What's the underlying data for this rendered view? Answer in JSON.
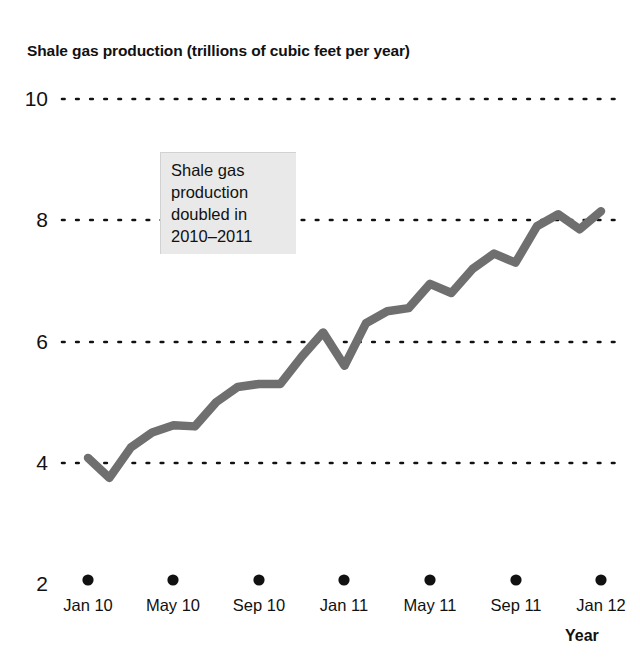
{
  "chart_data": {
    "type": "line",
    "title": "Shale gas production (trillions of cubic feet per year)",
    "xlabel": "Year",
    "ylabel": "",
    "ylim": [
      2,
      10
    ],
    "y_ticks": [
      10,
      8,
      6,
      4,
      2
    ],
    "x_ticks": [
      "Jan 10",
      "May 10",
      "Sep 10",
      "Jan 11",
      "May 11",
      "Sep 11",
      "Jan 12"
    ],
    "grid": "dotted-horizontal",
    "legend": "none",
    "line_color": "#6f6f6f",
    "annotations": [
      {
        "text": "Shale gas\nproduction\ndoubled in\n2010–2011",
        "x": "Jul 10",
        "y": 8.9
      }
    ],
    "x": [
      "Jan 10",
      "Feb 10",
      "Mar 10",
      "Apr 10",
      "May 10",
      "Jun 10",
      "Jul 10",
      "Aug 10",
      "Sep 10",
      "Oct 10",
      "Nov 10",
      "Dec 10",
      "Jan 11",
      "Feb 11",
      "Mar 11",
      "Apr 11",
      "May 11",
      "Jun 11",
      "Jul 11",
      "Aug 11",
      "Sep 11",
      "Oct 11",
      "Nov 11",
      "Dec 11",
      "Jan 12"
    ],
    "values": [
      4.08,
      3.75,
      4.25,
      4.5,
      4.62,
      4.6,
      5.0,
      5.25,
      5.3,
      5.3,
      5.75,
      6.15,
      5.6,
      6.3,
      6.5,
      6.55,
      6.95,
      6.8,
      7.2,
      7.45,
      7.3,
      7.9,
      8.1,
      7.85,
      8.15
    ],
    "units": "trillions of cubic feet per year"
  },
  "axis": {
    "y_labels": [
      "10",
      "8",
      "6",
      "4",
      "2"
    ],
    "x_labels": [
      "Jan 10",
      "May 10",
      "Sep 10",
      "Jan 11",
      "May 11",
      "Sep 11",
      "Jan 12"
    ],
    "x_title": "Year"
  },
  "annotation": {
    "line1": "Shale gas",
    "line2": "production",
    "line3": "doubled in",
    "line4": "2010–2011",
    "full": "Shale gas\nproduction\ndoubled in\n2010–2011"
  }
}
